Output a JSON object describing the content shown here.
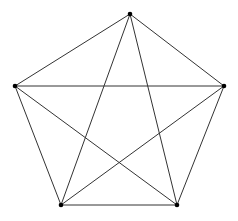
{
  "graph": {
    "name": "K5 complete graph",
    "nodes": [
      {
        "id": "top"
      },
      {
        "id": "left"
      },
      {
        "id": "right"
      },
      {
        "id": "bottom-left"
      },
      {
        "id": "bottom-right"
      }
    ],
    "edges": [
      [
        "top",
        "left"
      ],
      [
        "top",
        "right"
      ],
      [
        "top",
        "bottom-left"
      ],
      [
        "top",
        "bottom-right"
      ],
      [
        "left",
        "right"
      ],
      [
        "left",
        "bottom-left"
      ],
      [
        "left",
        "bottom-right"
      ],
      [
        "right",
        "bottom-left"
      ],
      [
        "right",
        "bottom-right"
      ],
      [
        "bottom-left",
        "bottom-right"
      ]
    ],
    "colors": {
      "edge": "#333333",
      "node": "#000000",
      "background": "#ffffff"
    }
  }
}
